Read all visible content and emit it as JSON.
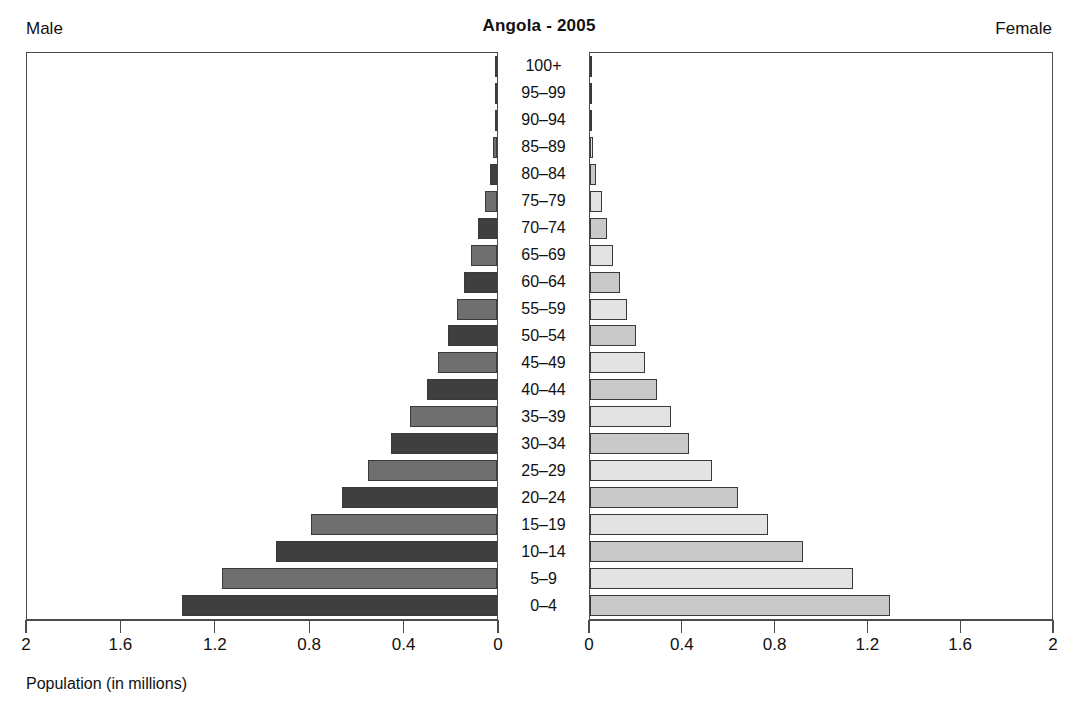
{
  "header": {
    "title": "Angola - 2005",
    "male_label": "Male",
    "female_label": "Female"
  },
  "axis": {
    "xlabel": "Population (in millions)",
    "male_ticks": [
      "2",
      "1.6",
      "1.2",
      "0.8",
      "0.4",
      "0"
    ],
    "female_ticks": [
      "0",
      "0.4",
      "0.8",
      "1.2",
      "1.6",
      "2"
    ],
    "tick_values": [
      0,
      0.4,
      0.8,
      1.2,
      1.6,
      2
    ],
    "xlim": [
      0,
      2
    ]
  },
  "chart_data": {
    "type": "bar",
    "subtype": "population-pyramid",
    "title": "Angola - 2005",
    "xlabel": "Population (in millions)",
    "ylabel": "",
    "xlim": [
      0,
      2
    ],
    "grid": false,
    "legend": [
      "Male",
      "Female"
    ],
    "legend_position": "top-corners",
    "categories": [
      "0–4",
      "5–9",
      "10–14",
      "15–19",
      "20–24",
      "25–29",
      "30–34",
      "35–39",
      "40–44",
      "45–49",
      "50–54",
      "55–59",
      "60–64",
      "65–69",
      "70–74",
      "75–79",
      "80–84",
      "85–89",
      "90–94",
      "95–99",
      "100+"
    ],
    "series": [
      {
        "name": "Male",
        "direction": "left",
        "values": [
          1.34,
          1.17,
          0.94,
          0.79,
          0.66,
          0.55,
          0.45,
          0.37,
          0.3,
          0.25,
          0.21,
          0.17,
          0.14,
          0.11,
          0.08,
          0.05,
          0.03,
          0.016,
          0.008,
          0.003,
          0.001
        ]
      },
      {
        "name": "Female",
        "direction": "right",
        "values": [
          1.3,
          1.14,
          0.92,
          0.77,
          0.64,
          0.53,
          0.43,
          0.35,
          0.29,
          0.24,
          0.2,
          0.16,
          0.13,
          0.1,
          0.075,
          0.05,
          0.028,
          0.015,
          0.007,
          0.003,
          0.001
        ]
      }
    ]
  }
}
